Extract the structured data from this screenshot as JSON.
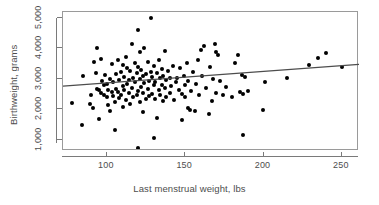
{
  "chart_data": {
    "type": "scatter",
    "title": "",
    "xlabel": "Last menstrual weight, lbs",
    "ylabel": "Birthweight, grams",
    "xlim": [
      72,
      261
    ],
    "ylim": [
      640,
      5180
    ],
    "grid": false,
    "legend": "none",
    "xticks": [
      100,
      150,
      200,
      250
    ],
    "xticklabels": [
      "100",
      "150",
      "200",
      "250"
    ],
    "yticks": [
      1000,
      2000,
      3000,
      4000,
      5000
    ],
    "yticklabels": [
      "1,000",
      "2,000",
      "3,000",
      "4,000",
      "5,000"
    ],
    "marker": "filled-circle",
    "marker_color": "#000000",
    "regression": {
      "type": "linear-fit",
      "color": "#4d4d4d",
      "x_start": 72,
      "y_start": 2760,
      "x_end": 261,
      "y_end": 3470,
      "slope": 3.76,
      "intercept": 2489
    },
    "points": [
      [
        78,
        2200
      ],
      [
        84,
        1490
      ],
      [
        85,
        3080
      ],
      [
        89,
        2190
      ],
      [
        90,
        2480
      ],
      [
        91,
        2060
      ],
      [
        92,
        3540
      ],
      [
        93,
        3180
      ],
      [
        94,
        2670
      ],
      [
        94,
        3990
      ],
      [
        95,
        1690
      ],
      [
        95,
        2620
      ],
      [
        96,
        2530
      ],
      [
        96,
        3640
      ],
      [
        97,
        2920
      ],
      [
        98,
        2480
      ],
      [
        98,
        2780
      ],
      [
        99,
        3130
      ],
      [
        100,
        2410
      ],
      [
        100,
        2820
      ],
      [
        101,
        2130
      ],
      [
        101,
        2640
      ],
      [
        102,
        3000
      ],
      [
        102,
        1940
      ],
      [
        103,
        2580
      ],
      [
        103,
        3470
      ],
      [
        104,
        2440
      ],
      [
        104,
        2900
      ],
      [
        105,
        1340
      ],
      [
        105,
        2240
      ],
      [
        106,
        2680
      ],
      [
        106,
        3150
      ],
      [
        107,
        2560
      ],
      [
        107,
        3600
      ],
      [
        108,
        2380
      ],
      [
        108,
        2950
      ],
      [
        109,
        2470
      ],
      [
        109,
        3220
      ],
      [
        110,
        2090
      ],
      [
        110,
        2750
      ],
      [
        110,
        3450
      ],
      [
        111,
        2630
      ],
      [
        111,
        3050
      ],
      [
        112,
        2290
      ],
      [
        112,
        3700
      ],
      [
        113,
        2840
      ],
      [
        113,
        3340
      ],
      [
        114,
        2520
      ],
      [
        114,
        2960
      ],
      [
        115,
        2170
      ],
      [
        115,
        3260
      ],
      [
        116,
        2700
      ],
      [
        116,
        4150
      ],
      [
        117,
        2390
      ],
      [
        117,
        3020
      ],
      [
        118,
        2880
      ],
      [
        118,
        3510
      ],
      [
        119,
        2460
      ],
      [
        119,
        3190
      ],
      [
        120,
        740
      ],
      [
        120,
        2600
      ],
      [
        120,
        3380
      ],
      [
        120,
        4580
      ],
      [
        121,
        2250
      ],
      [
        121,
        2990
      ],
      [
        121,
        3860
      ],
      [
        122,
        2730
      ],
      [
        122,
        3290
      ],
      [
        123,
        1900
      ],
      [
        123,
        2540
      ],
      [
        123,
        3090
      ],
      [
        124,
        2860
      ],
      [
        124,
        4020
      ],
      [
        125,
        2330
      ],
      [
        125,
        3140
      ],
      [
        126,
        2660
      ],
      [
        126,
        3560
      ],
      [
        127,
        2430
      ],
      [
        127,
        2940
      ],
      [
        128,
        3230
      ],
      [
        128,
        4990
      ],
      [
        129,
        2510
      ],
      [
        129,
        3070
      ],
      [
        130,
        1060
      ],
      [
        130,
        2780
      ],
      [
        130,
        3410
      ],
      [
        131,
        2350
      ],
      [
        131,
        2910
      ],
      [
        132,
        1730
      ],
      [
        132,
        3180
      ],
      [
        133,
        2620
      ],
      [
        133,
        3620
      ],
      [
        134,
        2470
      ],
      [
        134,
        3020
      ],
      [
        135,
        2810
      ],
      [
        135,
        3330
      ],
      [
        136,
        2280
      ],
      [
        136,
        3100
      ],
      [
        137,
        2690
      ],
      [
        137,
        3900
      ],
      [
        138,
        2420
      ],
      [
        138,
        2970
      ],
      [
        139,
        3240
      ],
      [
        140,
        2550
      ],
      [
        140,
        3040
      ],
      [
        141,
        2760
      ],
      [
        142,
        3430
      ],
      [
        143,
        2310
      ],
      [
        144,
        2880
      ],
      [
        145,
        3010
      ],
      [
        146,
        2640
      ],
      [
        147,
        3340
      ],
      [
        148,
        1650
      ],
      [
        148,
        2490
      ],
      [
        149,
        3100
      ],
      [
        150,
        2390
      ],
      [
        150,
        2800
      ],
      [
        151,
        3520
      ],
      [
        152,
        2060
      ],
      [
        152,
        2930
      ],
      [
        153,
        1990
      ],
      [
        154,
        2610
      ],
      [
        155,
        3210
      ],
      [
        156,
        1960
      ],
      [
        157,
        2840
      ],
      [
        158,
        3620
      ],
      [
        159,
        2470
      ],
      [
        160,
        3950
      ],
      [
        161,
        3080
      ],
      [
        162,
        4080
      ],
      [
        163,
        2690
      ],
      [
        165,
        1840
      ],
      [
        166,
        3390
      ],
      [
        167,
        2280
      ],
      [
        168,
        3000
      ],
      [
        169,
        4140
      ],
      [
        170,
        2550
      ],
      [
        170,
        3880
      ],
      [
        171,
        3760
      ],
      [
        172,
        2920
      ],
      [
        174,
        2460
      ],
      [
        176,
        2730
      ],
      [
        180,
        2390
      ],
      [
        182,
        3500
      ],
      [
        184,
        3790
      ],
      [
        185,
        2580
      ],
      [
        186,
        3130
      ],
      [
        187,
        1150
      ],
      [
        187,
        2490
      ],
      [
        188,
        3060
      ],
      [
        190,
        2600
      ],
      [
        200,
        1980
      ],
      [
        201,
        2890
      ],
      [
        215,
        3040
      ],
      [
        229,
        3450
      ],
      [
        235,
        3680
      ],
      [
        240,
        3830
      ],
      [
        250,
        3370
      ]
    ]
  },
  "axes": {
    "x_title": "Last menstrual weight, lbs",
    "y_title": "Birthweight, grams",
    "x_labels": [
      "100",
      "150",
      "200",
      "250"
    ],
    "y_labels": [
      "1,000",
      "2,000",
      "3,000",
      "4,000",
      "5,000"
    ]
  },
  "colors": {
    "point": "#000000",
    "line": "#4d4d4d",
    "frame": "#9a9a9a",
    "text": "#4d4d4d",
    "background": "#ffffff"
  }
}
